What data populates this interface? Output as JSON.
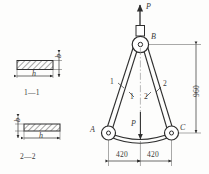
{
  "figure": {
    "type": "engineering-drawing"
  },
  "truss": {
    "points": {
      "apex": "B",
      "left_support": "A",
      "right_support": "C"
    },
    "load_top_label": "P",
    "load_center_label": "P",
    "members": [
      {
        "label": "1",
        "side": "left",
        "outer_mark": "1",
        "inner_mark": "1"
      },
      {
        "label": "2",
        "side": "right",
        "outer_mark": "2",
        "inner_mark": "2"
      }
    ]
  },
  "dimensions": {
    "height": "960",
    "half_span_left": "420",
    "half_span_right": "420"
  },
  "sections": [
    {
      "title": "1—1",
      "width_label": "h",
      "thickness_label": "b",
      "thickness_side": "right"
    },
    {
      "title": "2—2",
      "width_label": "h",
      "thickness_label": "b",
      "thickness_side": "left"
    }
  ],
  "colors": {
    "line": "#2e2e2e",
    "thin_line": "#555555",
    "hatch": "#3a3a3a",
    "background": "#fdfdfc"
  }
}
